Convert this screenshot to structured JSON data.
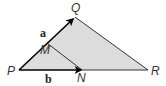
{
  "diagram": {
    "type": "vector-triangle",
    "colors": {
      "fill": "#dcdcdc",
      "stroke": "#333333",
      "arrow": "#000000",
      "background": "#ffffff"
    },
    "points": {
      "P": {
        "label": "P",
        "x": 19,
        "y": 70
      },
      "Q": {
        "label": "Q",
        "x": 75,
        "y": 17
      },
      "R": {
        "label": "R",
        "x": 148,
        "y": 70
      },
      "M": {
        "label": "M",
        "x": 47,
        "y": 43
      },
      "N": {
        "label": "N",
        "x": 82,
        "y": 70
      }
    },
    "vectors": [
      {
        "label": "a",
        "from": "P",
        "to": "Q"
      },
      {
        "label": "b",
        "from": "P",
        "to": "N"
      }
    ],
    "segments": [
      {
        "from": "Q",
        "to": "R"
      },
      {
        "from": "N",
        "to": "R"
      },
      {
        "from": "M",
        "to": "N"
      }
    ]
  }
}
